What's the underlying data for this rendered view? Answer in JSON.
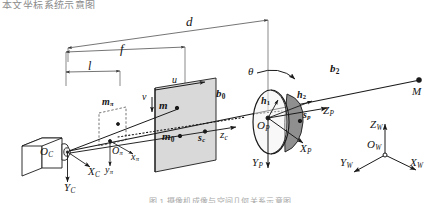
{
  "figure": {
    "title_fragment": "本文坐标系统示意图",
    "caption_fragment": "图 1  摄像机成像与空间几何关系示意图",
    "type": "camera-projection-geometry-diagram"
  },
  "colors": {
    "stroke": "#1a1a1a",
    "thin_stroke": "#6d6d6d",
    "image_plane_fill": "#d9d9d9",
    "cylinder_fill": "#8f8f8f",
    "ellipse_fill": "#f2f2f2",
    "camera_fill": "#ffffff",
    "background": "#ffffff"
  },
  "dimensions": [
    {
      "id": "d",
      "label": "d",
      "desc": "distance from camera centre to projection object"
    },
    {
      "id": "f",
      "label": "f",
      "desc": "focal length to image plane"
    },
    {
      "id": "l",
      "label": "l",
      "desc": "distance to normalized plane"
    }
  ],
  "camera": {
    "origin_label": "O",
    "origin_sub": "C",
    "axis_x": "X",
    "axis_x_sub": "C",
    "axis_y": "Y",
    "axis_y_sub": "C",
    "axis_z": "z",
    "axis_z_sub": "c",
    "principal_point": "s",
    "principal_point_sub": "c"
  },
  "normalized_plane": {
    "point_label": "m",
    "point_sub": "π",
    "origin_label": "O",
    "origin_sub": "π",
    "axis_x": "x",
    "axis_x_sub": "π",
    "axis_y": "y",
    "axis_y_sub": "π"
  },
  "image_plane": {
    "axis_u": "u",
    "axis_v": "v",
    "point_m": "m",
    "point_m0": "m",
    "point_m0_sub": "0"
  },
  "projection_object": {
    "origin_label": "O",
    "origin_sub": "P",
    "axis_x": "X",
    "axis_x_sub": "P",
    "axis_y": "Y",
    "axis_y_sub": "P",
    "axis_z": "Z",
    "axis_z_sub": "P",
    "point_s": "s",
    "point_s_sub": "p",
    "vector_h1": "h",
    "vector_h1_sub": "1",
    "vector_h2": "h",
    "vector_h2_sub": "2",
    "angle_theta": "θ"
  },
  "rays": {
    "b0": "b",
    "b0_sub": "0",
    "b2": "b",
    "b2_sub": "2",
    "scene_point": "M"
  },
  "world_frame": {
    "origin_label": "O",
    "origin_sub": "W",
    "axis_x": "X",
    "axis_x_sub": "W",
    "axis_y": "Y",
    "axis_y_sub": "W",
    "axis_z": "Z",
    "axis_z_sub": "W"
  }
}
